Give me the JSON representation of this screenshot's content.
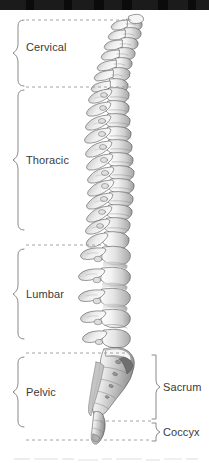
{
  "figure": {
    "background_color": "#ffffff",
    "line_color": "#8a8a8a",
    "text_color": "#3a3a3a",
    "top_bar_color": "#0b0b0b"
  },
  "left_regions": [
    {
      "label": "Cervical",
      "brace_top": 20,
      "brace_bottom": 86,
      "label_y": 47
    },
    {
      "label": "Thoracic",
      "brace_top": 90,
      "brace_bottom": 243,
      "label_y": 160
    },
    {
      "label": "Lumbar",
      "brace_top": 249,
      "brace_bottom": 351,
      "label_y": 294
    },
    {
      "label": "Pelvic",
      "brace_top": 357,
      "brace_bottom": 440,
      "label_y": 392
    }
  ],
  "right_regions": [
    {
      "label": "Sacrum",
      "brace_top": 355,
      "brace_bottom": 420,
      "label_y": 387
    },
    {
      "label": "Coccyx",
      "brace_top": 422,
      "brace_bottom": 440,
      "label_y": 432
    }
  ],
  "dividers": [
    {
      "y": 20,
      "x1": 26,
      "x2": 133
    },
    {
      "y": 87,
      "x1": 26,
      "x2": 133
    },
    {
      "y": 245,
      "x1": 26,
      "x2": 110
    },
    {
      "y": 353,
      "x1": 26,
      "x2": 128
    },
    {
      "y": 421,
      "x1": 100,
      "x2": 150
    },
    {
      "y": 440,
      "x1": 26,
      "x2": 150
    }
  ],
  "illustration": {
    "name": "vertebral-column-lateral-view",
    "style": "engraving",
    "segments": [
      {
        "region": "cervical",
        "count": 7,
        "y_start": 18,
        "y_end": 86
      },
      {
        "region": "thoracic",
        "count": 12,
        "y_start": 86,
        "y_end": 246
      },
      {
        "region": "lumbar",
        "count": 5,
        "y_start": 246,
        "y_end": 352
      },
      {
        "region": "sacrum",
        "count": 1,
        "y_start": 352,
        "y_end": 420
      },
      {
        "region": "coccyx",
        "count": 1,
        "y_start": 420,
        "y_end": 445
      }
    ]
  },
  "caption": {
    "text": ""
  }
}
